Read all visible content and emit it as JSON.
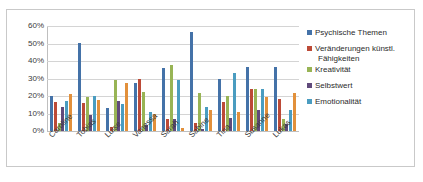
{
  "chart_data": {
    "type": "bar",
    "title": "",
    "subtitle": "",
    "xlabel": "",
    "ylabel": "",
    "ylim": [
      0,
      60
    ],
    "ytick_labels": [
      "60%",
      "50%",
      "40%",
      "30%",
      "20%",
      "10%",
      "0%"
    ],
    "ytick_values": [
      60,
      50,
      40,
      30,
      20,
      10,
      0
    ],
    "grid": true,
    "legend_position": "right",
    "value_suffix": "%",
    "categories": [
      "Caroline",
      "Tobias",
      "Luise",
      "Vanessa",
      "Sarah",
      "Sabine",
      "Tina",
      "Susanne",
      "Lukas"
    ],
    "series": [
      {
        "name": "Psychische Themen",
        "color": "#4472a8",
        "in_legend": true,
        "values": [
          20.0,
          50.2,
          13.2,
          27.5,
          36.2,
          56.3,
          29.6,
          36.4,
          36.6
        ]
      },
      {
        "name": "Veränderungen künstl. Fähigkeiten",
        "color": "#bc4a37",
        "in_legend": true,
        "values": [
          16.3,
          16.1,
          2.4,
          29.8,
          7.0,
          4.4,
          16.6,
          24.1,
          18.2
        ]
      },
      {
        "name": "Kreativität",
        "color": "#98b455",
        "in_legend": true,
        "values": [
          4.8,
          19.2,
          29.0,
          22.1,
          38.0,
          21.8,
          20.1,
          24.2,
          7.0
        ]
      },
      {
        "name": "Selbstwert",
        "color": "#604a7b",
        "in_legend": true,
        "values": [
          13.5,
          9.4,
          17.0,
          3.4,
          7.0,
          1.0,
          7.2,
          12.0,
          4.0
        ]
      },
      {
        "name": "Emotionalität",
        "color": "#4a9cc0",
        "in_legend": true,
        "values": [
          17.3,
          20.0,
          15.6,
          11.0,
          29.0,
          14.0,
          32.9,
          24.1,
          11.8
        ]
      },
      {
        "name": "",
        "color": "#e2903b",
        "in_legend": false,
        "values": [
          21.0,
          18.0,
          27.5,
          9.5,
          1.6,
          11.9,
          10.9,
          19.5,
          21.6
        ]
      }
    ]
  },
  "legend": {
    "entries": [
      {
        "label": "Psychische Themen",
        "label_line2": "",
        "color": "#4472a8"
      },
      {
        "label": "Veränderungen künstl.",
        "label_line2": "Fähigkeiten",
        "color": "#bc4a37"
      },
      {
        "label": "Kreativität",
        "label_line2": "",
        "color": "#98b455"
      },
      {
        "label": "Selbstwert",
        "label_line2": "",
        "color": "#604a7b"
      },
      {
        "label": "Emotionalität",
        "label_line2": "",
        "color": "#4a9cc0"
      }
    ]
  },
  "theme": {
    "plot_background": "#ffffff",
    "gridline_color": "#d4d4d4",
    "axis_color": "#bfbfbf",
    "border_color": "#c9c9c9",
    "text_color": "#3a3a3a"
  }
}
